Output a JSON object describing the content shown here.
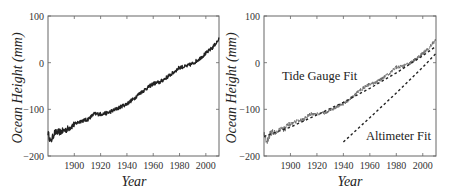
{
  "chart_data": [
    {
      "type": "line",
      "panel": "left",
      "title": "",
      "xlabel": "Year",
      "ylabel": "Ocean Height (mm)",
      "xlim": [
        1880,
        2010
      ],
      "ylim": [
        -200,
        100
      ],
      "xticks": [
        1900,
        1920,
        1940,
        1960,
        1980,
        2000
      ],
      "yticks": [
        -200,
        -100,
        0,
        100
      ],
      "grid": false,
      "series": [
        {
          "name": "Tide gauge record",
          "style": "solid-noisy",
          "color": "#222222",
          "x": [
            1880,
            1882,
            1885,
            1890,
            1895,
            1900,
            1905,
            1910,
            1915,
            1920,
            1925,
            1930,
            1935,
            1940,
            1945,
            1950,
            1955,
            1960,
            1965,
            1970,
            1975,
            1980,
            1985,
            1990,
            1995,
            2000,
            2005,
            2010
          ],
          "values": [
            -150,
            -170,
            -150,
            -148,
            -142,
            -132,
            -125,
            -122,
            -110,
            -110,
            -108,
            -102,
            -95,
            -88,
            -78,
            -65,
            -55,
            -45,
            -42,
            -32,
            -22,
            -10,
            -8,
            -2,
            8,
            20,
            32,
            50
          ]
        }
      ]
    },
    {
      "type": "line",
      "panel": "right",
      "title": "",
      "xlabel": "Year",
      "ylabel": "Ocean Height (mm)",
      "xlim": [
        1880,
        2010
      ],
      "ylim": [
        -200,
        100
      ],
      "xticks": [
        1900,
        1920,
        1940,
        1960,
        1980,
        2000
      ],
      "yticks": [
        -200,
        -100,
        0,
        100
      ],
      "grid": false,
      "annotations": [
        {
          "text": "Tide Gauge Fit",
          "x": 1915,
          "y": -20
        },
        {
          "text": "Altimeter Fit",
          "x": 1962,
          "y": -155
        }
      ],
      "series": [
        {
          "name": "Tide gauge record",
          "style": "solid-noisy",
          "color": "#666666",
          "x": [
            1880,
            1882,
            1885,
            1890,
            1895,
            1900,
            1905,
            1910,
            1915,
            1920,
            1925,
            1930,
            1935,
            1940,
            1945,
            1950,
            1955,
            1960,
            1965,
            1970,
            1975,
            1980,
            1985,
            1990,
            1995,
            2000,
            2005,
            2010
          ],
          "values": [
            -150,
            -170,
            -150,
            -148,
            -142,
            -132,
            -125,
            -122,
            -110,
            -110,
            -108,
            -102,
            -95,
            -88,
            -78,
            -65,
            -55,
            -45,
            -42,
            -32,
            -22,
            -10,
            -8,
            -2,
            8,
            20,
            32,
            50
          ]
        },
        {
          "name": "Tide Gauge Fit",
          "style": "dashed",
          "color": "#222222",
          "x": [
            1880,
            1900,
            1920,
            1940,
            1960,
            1980,
            2000,
            2010
          ],
          "values": [
            -158,
            -138,
            -112,
            -85,
            -55,
            -22,
            15,
            35
          ]
        },
        {
          "name": "Altimeter Fit",
          "style": "dashed",
          "color": "#222222",
          "x": [
            1940,
            1960,
            1980,
            2000,
            2010
          ],
          "values": [
            -170,
            -118,
            -65,
            -10,
            20
          ]
        }
      ]
    }
  ],
  "labels": {
    "xlabel": "Year",
    "ylabel": "Ocean Height (mm)",
    "xticks": [
      "1900",
      "1920",
      "1940",
      "1960",
      "1980",
      "2000"
    ],
    "yticks": [
      "100",
      "0",
      "−100",
      "−200"
    ],
    "annot_tide": "Tide Gauge Fit",
    "annot_alt": "Altimeter Fit"
  }
}
